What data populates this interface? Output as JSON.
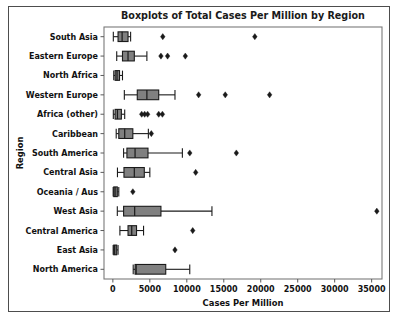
{
  "figure": {
    "title": "Boxplots of Total Cases Per Million by Region",
    "xlabel": "Cases Per Million",
    "ylabel": "Region"
  },
  "chart_data": {
    "type": "boxplot",
    "title": "Boxplots of Total Cases Per Million by Region",
    "xlabel": "Cases Per Million",
    "ylabel": "Region",
    "orientation": "horizontal",
    "xlim": [
      -1200,
      36400
    ],
    "xticks": [
      0,
      5000,
      10000,
      15000,
      20000,
      25000,
      30000,
      35000
    ],
    "xticklabels": [
      "0",
      "5000",
      "10000",
      "15000",
      "20000",
      "25000",
      "30000",
      "35000"
    ],
    "grid": false,
    "legend": null,
    "box_facecolor": "#808080",
    "box_edgecolor": "#1a1a1a",
    "categories": [
      "South Asia",
      "Eastern Europe",
      "North Africa",
      "Western Europe",
      "Africa (other)",
      "Caribbean",
      "South America",
      "Central Asia",
      "Oceania / Aus",
      "West Asia",
      "Central America",
      "East Asia",
      "North America"
    ],
    "boxes": [
      {
        "label": "South Asia",
        "whisker_low": 60,
        "q1": 700,
        "median": 1250,
        "q3": 2050,
        "whisker_high": 2400,
        "fliers": [
          6750,
          19200
        ]
      },
      {
        "label": "Eastern Europe",
        "whisker_low": 520,
        "q1": 1300,
        "median": 2050,
        "q3": 2900,
        "whisker_high": 4600,
        "fliers": [
          6500,
          7400,
          9800
        ]
      },
      {
        "label": "North Africa",
        "whisker_low": 120,
        "q1": 300,
        "median": 560,
        "q3": 900,
        "whisker_high": 1300,
        "fliers": []
      },
      {
        "label": "Western Europe",
        "whisker_low": 1550,
        "q1": 3300,
        "median": 4600,
        "q3": 6200,
        "whisker_high": 8400,
        "fliers": [
          11600,
          15200,
          21200
        ]
      },
      {
        "label": "Africa (other)",
        "whisker_low": 60,
        "q1": 300,
        "median": 620,
        "q3": 1150,
        "whisker_high": 1600,
        "fliers": [
          3900,
          4300,
          4700,
          6200,
          6700
        ]
      },
      {
        "label": "Caribbean",
        "whisker_low": 450,
        "q1": 800,
        "median": 1600,
        "q3": 2700,
        "whisker_high": 4800,
        "fliers": [
          5200
        ]
      },
      {
        "label": "South America",
        "whisker_low": 1450,
        "q1": 1900,
        "median": 3000,
        "q3": 4750,
        "whisker_high": 9400,
        "fliers": [
          10400,
          16700
        ]
      },
      {
        "label": "Central Asia",
        "whisker_low": 620,
        "q1": 1500,
        "median": 2900,
        "q3": 4250,
        "whisker_high": 5000,
        "fliers": [
          11200
        ]
      },
      {
        "label": "Oceania / Aus",
        "whisker_low": 40,
        "q1": 120,
        "median": 300,
        "q3": 600,
        "whisker_high": 800,
        "fliers": [
          2700
        ]
      },
      {
        "label": "West Asia",
        "whisker_low": 600,
        "q1": 1450,
        "median": 2950,
        "q3": 6500,
        "whisker_high": 13400,
        "fliers": [
          35700
        ]
      },
      {
        "label": "Central America",
        "whisker_low": 950,
        "q1": 2050,
        "median": 2550,
        "q3": 3200,
        "whisker_high": 4150,
        "fliers": [
          10800
        ]
      },
      {
        "label": "East Asia",
        "whisker_low": 40,
        "q1": 120,
        "median": 250,
        "q3": 520,
        "whisker_high": 700,
        "fliers": [
          8400
        ]
      },
      {
        "label": "North America",
        "whisker_low": 2750,
        "q1": 3000,
        "median": 3150,
        "q3": 7150,
        "whisker_high": 10400,
        "fliers": []
      }
    ]
  }
}
